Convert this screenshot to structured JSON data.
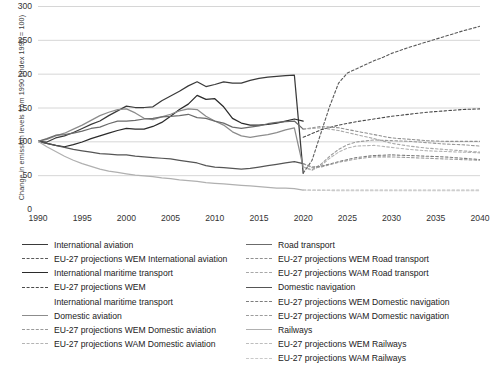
{
  "chart_data": {
    "type": "line",
    "title": "",
    "xlabel": "",
    "ylabel": "Change in emission levels from 1990 (index 1990 = 100)",
    "xlim": [
      1990,
      2040
    ],
    "ylim": [
      0,
      300
    ],
    "xticks": [
      "1990",
      "1995",
      "2000",
      "2005",
      "2010",
      "2015",
      "2020",
      "2025",
      "2030",
      "2035",
      "2040"
    ],
    "yticks": [
      "0",
      "50",
      "100",
      "150",
      "200",
      "250",
      "300"
    ],
    "grid": "horizontal",
    "legend_position": "bottom",
    "projection_start": 2020,
    "series": [
      {
        "name": "International aviation",
        "style": "solid",
        "color": "#3a3a3a",
        "x": [
          1990,
          1991,
          1992,
          1993,
          1994,
          1995,
          1996,
          1997,
          1998,
          1999,
          2000,
          2001,
          2002,
          2003,
          2004,
          2005,
          2006,
          2007,
          2008,
          2009,
          2010,
          2011,
          2012,
          2013,
          2014,
          2015,
          2016,
          2017,
          2018,
          2019,
          2020
        ],
        "values": [
          100,
          99,
          105,
          108,
          113,
          119,
          125,
          130,
          138,
          145,
          152,
          150,
          150,
          151,
          160,
          167,
          174,
          182,
          188,
          181,
          184,
          188,
          186,
          186,
          190,
          193,
          195,
          196,
          197,
          198,
          53
        ]
      },
      {
        "name": "EU-27 projections WEM International aviation",
        "style": "dashed",
        "color": "#5a5a5a",
        "x": [
          2020,
          2021,
          2022,
          2023,
          2024,
          2025,
          2026,
          2027,
          2028,
          2029,
          2030,
          2032,
          2034,
          2036,
          2038,
          2040
        ],
        "values": [
          53,
          72,
          112,
          152,
          186,
          201,
          207,
          213,
          219,
          224,
          230,
          239,
          247,
          255,
          263,
          270
        ]
      },
      {
        "name": "International maritime transport",
        "style": "solid",
        "color": "#2b2b2b",
        "x": [
          1990,
          1991,
          1992,
          1993,
          1994,
          1995,
          1996,
          1997,
          1998,
          1999,
          2000,
          2001,
          2002,
          2003,
          2004,
          2005,
          2006,
          2007,
          2008,
          2009,
          2010,
          2011,
          2012,
          2013,
          2014,
          2015,
          2016,
          2017,
          2018,
          2019,
          2020
        ],
        "values": [
          100,
          97,
          94,
          92,
          95,
          99,
          104,
          108,
          112,
          116,
          119,
          118,
          118,
          122,
          128,
          137,
          147,
          155,
          168,
          162,
          163,
          151,
          134,
          127,
          124,
          124,
          125,
          127,
          130,
          133,
          130
        ]
      },
      {
        "name": "EU-27 projections WEM International maritime transport",
        "style": "dashed",
        "color": "#4a4a4a",
        "x": [
          2020,
          2022,
          2024,
          2026,
          2028,
          2030,
          2032,
          2034,
          2036,
          2038,
          2040
        ],
        "values": [
          106,
          117,
          124,
          129,
          133,
          137,
          140,
          143,
          145,
          147,
          148
        ]
      },
      {
        "name": "Domestic aviation",
        "style": "solid",
        "color": "#8c8c8c",
        "x": [
          1990,
          1991,
          1992,
          1993,
          1994,
          1995,
          1996,
          1997,
          1998,
          1999,
          2000,
          2001,
          2002,
          2003,
          2004,
          2005,
          2006,
          2007,
          2008,
          2009,
          2010,
          2011,
          2012,
          2013,
          2014,
          2015,
          2016,
          2017,
          2018,
          2019,
          2020
        ],
        "values": [
          100,
          103,
          108,
          112,
          118,
          124,
          131,
          138,
          143,
          147,
          148,
          142,
          134,
          132,
          136,
          140,
          145,
          148,
          147,
          137,
          130,
          124,
          114,
          108,
          106,
          108,
          110,
          113,
          117,
          120,
          62
        ]
      },
      {
        "name": "EU-27 projections WEM Domestic aviation",
        "style": "dashed",
        "color": "#9a9a9a",
        "x": [
          2020,
          2021,
          2022,
          2023,
          2024,
          2025,
          2026,
          2028,
          2030,
          2032,
          2034,
          2036,
          2038,
          2040
        ],
        "values": [
          62,
          58,
          66,
          78,
          88,
          95,
          99,
          102,
          101,
          100,
          98,
          96,
          95,
          93
        ]
      },
      {
        "name": "EU-27 projections WAM Domestic aviation",
        "style": "dashed",
        "color": "#b4b4b4",
        "x": [
          2020,
          2021,
          2022,
          2023,
          2024,
          2025,
          2026,
          2028,
          2030,
          2032,
          2034,
          2036,
          2038,
          2040
        ],
        "values": [
          62,
          57,
          64,
          75,
          84,
          90,
          93,
          94,
          91,
          88,
          86,
          85,
          84,
          83
        ]
      },
      {
        "name": "Road transport",
        "style": "solid",
        "color": "#6b6b6b",
        "x": [
          1990,
          1991,
          1992,
          1993,
          1994,
          1995,
          1996,
          1997,
          1998,
          1999,
          2000,
          2001,
          2002,
          2003,
          2004,
          2005,
          2006,
          2007,
          2008,
          2009,
          2010,
          2011,
          2012,
          2013,
          2014,
          2015,
          2016,
          2017,
          2018,
          2019,
          2020
        ],
        "values": [
          100,
          104,
          109,
          110,
          112,
          115,
          119,
          121,
          126,
          130,
          130,
          131,
          133,
          134,
          136,
          137,
          138,
          140,
          135,
          134,
          130,
          127,
          121,
          119,
          121,
          123,
          126,
          128,
          129,
          130,
          118
        ]
      },
      {
        "name": "EU-27 projections WEM Road transport",
        "style": "dashed",
        "color": "#909090",
        "x": [
          2020,
          2022,
          2024,
          2026,
          2028,
          2030,
          2032,
          2034,
          2036,
          2038,
          2040
        ],
        "values": [
          118,
          122,
          120,
          115,
          110,
          105,
          103,
          101,
          100,
          100,
          100
        ]
      },
      {
        "name": "EU-27 projections WAM Road transport",
        "style": "dashed",
        "color": "#a8a8a8",
        "x": [
          2020,
          2022,
          2024,
          2026,
          2028,
          2030,
          2032,
          2034,
          2036,
          2038,
          2040
        ],
        "values": [
          118,
          120,
          116,
          110,
          104,
          97,
          93,
          90,
          88,
          86,
          84
        ]
      },
      {
        "name": "Domestic navigation",
        "style": "solid",
        "color": "#555555",
        "x": [
          1990,
          1991,
          1992,
          1993,
          1994,
          1995,
          1996,
          1997,
          1998,
          1999,
          2000,
          2001,
          2002,
          2003,
          2004,
          2005,
          2006,
          2007,
          2008,
          2009,
          2010,
          2011,
          2012,
          2013,
          2014,
          2015,
          2016,
          2017,
          2018,
          2019,
          2020
        ],
        "values": [
          100,
          97,
          94,
          91,
          88,
          86,
          84,
          82,
          81,
          80,
          80,
          78,
          77,
          76,
          75,
          74,
          72,
          70,
          68,
          64,
          62,
          61,
          60,
          59,
          60,
          62,
          64,
          66,
          68,
          70,
          67
        ]
      },
      {
        "name": "EU-27 projections WEM Domestic navigation",
        "style": "dashed",
        "color": "#7d7d7d",
        "x": [
          2020,
          2021,
          2022,
          2024,
          2026,
          2028,
          2030,
          2032,
          2034,
          2036,
          2038,
          2040
        ],
        "values": [
          67,
          62,
          63,
          70,
          76,
          79,
          80,
          79,
          78,
          77,
          75,
          73
        ]
      },
      {
        "name": "EU-27 projections WAM Domestic navigation",
        "style": "dashed",
        "color": "#9c9c9c",
        "x": [
          2020,
          2021,
          2022,
          2024,
          2026,
          2028,
          2030,
          2032,
          2034,
          2036,
          2038,
          2040
        ],
        "values": [
          67,
          61,
          62,
          69,
          74,
          77,
          77,
          76,
          75,
          74,
          73,
          72
        ]
      },
      {
        "name": "Railways",
        "style": "solid",
        "color": "#b0b0b0",
        "x": [
          1990,
          1991,
          1992,
          1993,
          1994,
          1995,
          1996,
          1997,
          1998,
          1999,
          2000,
          2001,
          2002,
          2003,
          2004,
          2005,
          2006,
          2007,
          2008,
          2009,
          2010,
          2011,
          2012,
          2013,
          2014,
          2015,
          2016,
          2017,
          2018,
          2019,
          2020
        ],
        "values": [
          100,
          92,
          85,
          78,
          72,
          67,
          63,
          59,
          56,
          54,
          52,
          50,
          49,
          48,
          46,
          45,
          43,
          42,
          41,
          39,
          38,
          37,
          36,
          35,
          34,
          33,
          32,
          31,
          31,
          30,
          28
        ]
      },
      {
        "name": "EU-27 projections WEM Railways",
        "style": "dashed",
        "color": "#bdbdbd",
        "x": [
          2020,
          2024,
          2028,
          2032,
          2036,
          2040
        ],
        "values": [
          28,
          28,
          28,
          28,
          28,
          28
        ]
      },
      {
        "name": "EU-27 projections WAM Railways",
        "style": "dashed",
        "color": "#c9c9c9",
        "x": [
          2020,
          2024,
          2028,
          2032,
          2036,
          2040
        ],
        "values": [
          28,
          27,
          27,
          27,
          27,
          27
        ]
      }
    ]
  },
  "legend": {
    "left": [
      {
        "label": "International aviation",
        "key": "solid",
        "color": "#3a3a3a"
      },
      {
        "label": "EU-27 projections WEM International aviation",
        "key": "dash",
        "color": "#5a5a5a"
      },
      {
        "label": "International maritime transport",
        "key": "solid",
        "color": "#2b2b2b"
      },
      {
        "label": "EU-27 projections WEM",
        "key": "dash",
        "color": "#4a4a4a"
      },
      {
        "label": "International maritime transport",
        "key": "blank",
        "color": "#4a4a4a"
      },
      {
        "label": "Domestic aviation",
        "key": "solid",
        "color": "#8c8c8c"
      },
      {
        "label": "EU-27 projections WEM Domestic aviation",
        "key": "dash",
        "color": "#9a9a9a"
      },
      {
        "label": "EU-27 projections WAM Domestic aviation",
        "key": "dash",
        "color": "#b4b4b4"
      }
    ],
    "right": [
      {
        "label": "Road transport",
        "key": "solid",
        "color": "#6b6b6b"
      },
      {
        "label": "EU-27 projections WEM Road transport",
        "key": "dash",
        "color": "#909090"
      },
      {
        "label": "EU-27 projections WAM Road transport",
        "key": "dash",
        "color": "#a8a8a8"
      },
      {
        "label": "Domestic navigation",
        "key": "solid",
        "color": "#555555"
      },
      {
        "label": "EU-27 projections WEM Domestic navigation",
        "key": "dash",
        "color": "#7d7d7d"
      },
      {
        "label": "EU-27 projections WAM Domestic navigation",
        "key": "dash",
        "color": "#9c9c9c"
      },
      {
        "label": "Railways",
        "key": "solid",
        "color": "#b0b0b0"
      },
      {
        "label": "EU-27 projections WEM Railways",
        "key": "dash",
        "color": "#bdbdbd"
      },
      {
        "label": "EU-27 projections WAM Railways",
        "key": "dash",
        "color": "#c9c9c9"
      }
    ]
  }
}
